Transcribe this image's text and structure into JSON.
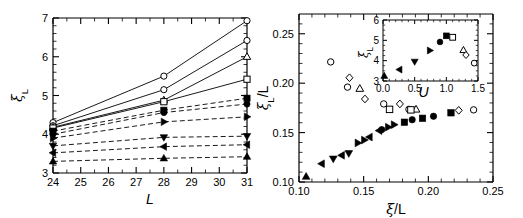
{
  "figure": {
    "panels": [
      "left-panel",
      "right-panel"
    ],
    "background": "#ffffff",
    "ink": "#000000"
  },
  "chart_data": [
    {
      "id": "left-panel",
      "type": "line",
      "title": "",
      "xlabel": "L",
      "ylabel": "ξ_L",
      "xlim": [
        24,
        31
      ],
      "ylim": [
        3,
        7
      ],
      "xticks": [
        24,
        25,
        26,
        27,
        28,
        29,
        30,
        31
      ],
      "xticklabels": [
        "24",
        "25",
        "26",
        "27",
        "28",
        "29",
        "30",
        "31"
      ],
      "yticks": [
        3,
        4,
        5,
        6,
        7
      ],
      "yticklabels": [
        "3",
        "4",
        "5",
        "6",
        "7"
      ],
      "grid": false,
      "legend": "none",
      "x": [
        24,
        28,
        31
      ],
      "series": [
        {
          "name": "open-circle-upper",
          "marker": "circle-open",
          "line": "solid",
          "values": [
            4.3,
            5.5,
            6.93
          ]
        },
        {
          "name": "open-circle-lower",
          "marker": "circle-open",
          "line": "solid",
          "values": [
            4.22,
            5.15,
            6.42
          ]
        },
        {
          "name": "open-triangle-up",
          "marker": "triangle-open",
          "line": "solid",
          "values": [
            4.18,
            4.88,
            6.0
          ]
        },
        {
          "name": "open-square",
          "marker": "square-open",
          "line": "solid",
          "values": [
            4.16,
            4.84,
            5.42
          ]
        },
        {
          "name": "filled-square",
          "marker": "square-filled",
          "line": "dashed",
          "values": [
            4.08,
            4.62,
            4.93
          ]
        },
        {
          "name": "filled-circle",
          "marker": "circle-filled",
          "line": "dashed",
          "values": [
            4.0,
            4.56,
            4.78
          ]
        },
        {
          "name": "filled-right-tri",
          "marker": "triangle-right",
          "line": "dashed",
          "values": [
            3.9,
            4.32,
            4.45
          ]
        },
        {
          "name": "filled-down-tri",
          "marker": "triangle-down",
          "line": "dashed",
          "values": [
            3.7,
            3.92,
            3.95
          ]
        },
        {
          "name": "filled-left-tri",
          "marker": "triangle-left",
          "line": "dashed",
          "values": [
            3.52,
            3.68,
            3.73
          ]
        },
        {
          "name": "filled-up-tri",
          "marker": "triangle-up",
          "line": "dashed",
          "values": [
            3.3,
            3.38,
            3.42
          ]
        }
      ]
    },
    {
      "id": "right-panel",
      "type": "scatter",
      "title": "",
      "xlabel": "ξ/L",
      "ylabel": "ξ_L/L",
      "xlim": [
        0.1,
        0.25
      ],
      "ylim": [
        0.1,
        0.27
      ],
      "xticks": [
        0.1,
        0.15,
        0.2,
        0.25
      ],
      "xticklabels": [
        "0.10",
        "0.15",
        "0.20",
        "0.25"
      ],
      "yticks": [
        0.1,
        0.15,
        0.2,
        0.25
      ],
      "yticklabels": [
        "0.10",
        "0.15",
        "0.20",
        "0.25"
      ],
      "grid": false,
      "legend": "none",
      "series": [
        {
          "name": "filled-up-tri",
          "marker": "triangle-up",
          "points": [
            [
              0.1055,
              0.1055
            ]
          ]
        },
        {
          "name": "filled-left-tri",
          "marker": "triangle-left",
          "points": [
            [
              0.1175,
              0.1185
            ],
            [
              0.133,
              0.127
            ],
            [
              0.1545,
              0.1455
            ],
            [
              0.162,
              0.152
            ]
          ]
        },
        {
          "name": "filled-down-tri",
          "marker": "triangle-down",
          "points": [
            [
              0.1265,
              0.1235
            ],
            [
              0.1385,
              0.129
            ]
          ]
        },
        {
          "name": "filled-right-tri",
          "marker": "triangle-right",
          "points": [
            [
              0.1455,
              0.1395
            ],
            [
              0.1505,
              0.1425
            ],
            [
              0.169,
              0.1555
            ],
            [
              0.1735,
              0.158
            ]
          ]
        },
        {
          "name": "filled-circle",
          "marker": "circle-filled",
          "points": [
            [
              0.164,
              0.153
            ],
            [
              0.1875,
              0.163
            ],
            [
              0.204,
              0.1665
            ]
          ]
        },
        {
          "name": "filled-square",
          "marker": "square-filled",
          "points": [
            [
              0.1815,
              0.1605
            ],
            [
              0.1955,
              0.1645
            ],
            [
              0.2175,
              0.17
            ]
          ]
        },
        {
          "name": "open-circle",
          "marker": "circle-open",
          "points": [
            [
              0.1245,
              0.2215
            ],
            [
              0.1375,
              0.196
            ],
            [
              0.1655,
              0.179
            ],
            [
              0.185,
              0.1735
            ],
            [
              0.235,
              0.173
            ]
          ]
        },
        {
          "name": "open-diamond",
          "marker": "diamond-open",
          "points": [
            [
              0.139,
              0.2055
            ],
            [
              0.151,
              0.184
            ],
            [
              0.178,
              0.179
            ],
            [
              0.2235,
              0.1725
            ]
          ]
        },
        {
          "name": "open-triangle",
          "marker": "triangle-open",
          "points": [
            [
              0.147,
              0.1945
            ],
            [
              0.1905,
              0.1735
            ]
          ]
        },
        {
          "name": "open-square",
          "marker": "square-open",
          "points": [
            [
              0.17,
              0.1735
            ],
            [
              0.1865,
              0.173
            ]
          ]
        }
      ],
      "inset": {
        "id": "right-panel-inset",
        "type": "scatter",
        "xlabel": "U",
        "ylabel": "ξ_L",
        "xlim": [
          0.0,
          1.5
        ],
        "ylim": [
          3,
          6
        ],
        "xticks": [
          0.0,
          0.5,
          1.0,
          1.5
        ],
        "xticklabels": [
          "0.0",
          "0.5",
          "1.0",
          "1.5"
        ],
        "yticks": [
          3,
          4,
          5,
          6
        ],
        "yticklabels": [
          "3",
          "4",
          "5",
          "6"
        ],
        "grid": false,
        "series": [
          {
            "name": "filled-up-tri",
            "marker": "triangle-up",
            "points": [
              [
                0.02,
                3.25
              ]
            ]
          },
          {
            "name": "filled-left-tri",
            "marker": "triangle-left",
            "points": [
              [
                0.26,
                3.56
              ]
            ]
          },
          {
            "name": "filled-down-tri",
            "marker": "triangle-down",
            "points": [
              [
                0.5,
                3.95
              ]
            ]
          },
          {
            "name": "filled-right-tri",
            "marker": "triangle-right",
            "points": [
              [
                0.74,
                4.5
              ]
            ]
          },
          {
            "name": "filled-circle",
            "marker": "circle-filled",
            "points": [
              [
                0.9,
                4.92
              ]
            ]
          },
          {
            "name": "filled-square",
            "marker": "square-filled",
            "points": [
              [
                1.0,
                5.22
              ]
            ]
          },
          {
            "name": "open-square",
            "marker": "square-open",
            "points": [
              [
                1.1,
                5.15
              ]
            ]
          },
          {
            "name": "open-triangle",
            "marker": "triangle-open",
            "points": [
              [
                1.27,
                4.52
              ]
            ]
          },
          {
            "name": "open-diamond",
            "marker": "diamond-open",
            "points": [
              [
                1.31,
                4.28
              ]
            ]
          },
          {
            "name": "open-circle",
            "marker": "circle-open",
            "points": [
              [
                1.44,
                3.88
              ]
            ]
          }
        ]
      }
    }
  ]
}
